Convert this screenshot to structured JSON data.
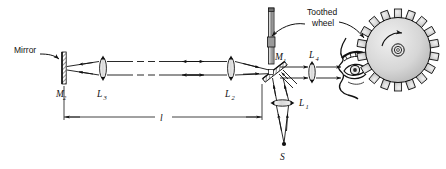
{
  "figure": {
    "type": "optics-ray-diagram",
    "background": "#ffffff",
    "ink": "#111111"
  },
  "labels": {
    "mirror": "Mirror",
    "toothed_wheel_line1": "Toothed",
    "toothed_wheel_line2": "wheel",
    "mirror_far": "M",
    "mirror_far_sub": "2",
    "beam_splitter": "M",
    "beam_splitter_sub": "1",
    "lens1": "L",
    "lens1_sub": "1",
    "lens2": "L",
    "lens2_sub": "2",
    "lens3": "L",
    "lens3_sub": "3",
    "lens4": "L",
    "lens4_sub": "4",
    "source": "S",
    "distance": "l"
  },
  "components": [
    {
      "name": "mirror-M2",
      "label": "M2",
      "kind": "plane-mirror",
      "x": 62,
      "y": 62,
      "orientation": "vertical"
    },
    {
      "name": "lens-L3",
      "label": "L3",
      "kind": "converging-lens",
      "x": 103,
      "y": 68,
      "orientation": "vertical"
    },
    {
      "name": "lens-L2",
      "label": "L2",
      "kind": "converging-lens",
      "x": 231,
      "y": 68,
      "orientation": "vertical"
    },
    {
      "name": "beam-splitter-M1",
      "label": "M1",
      "kind": "tilted-half-silvered-mirror",
      "x": 275,
      "y": 72,
      "orientation": "tilted"
    },
    {
      "name": "lens-L4",
      "label": "L4",
      "kind": "converging-lens",
      "x": 312,
      "y": 72,
      "orientation": "vertical"
    },
    {
      "name": "lens-L1",
      "label": "L1",
      "kind": "converging-lens",
      "x": 281,
      "y": 103,
      "orientation": "horizontal"
    },
    {
      "name": "source-S",
      "label": "S",
      "kind": "point-light-source",
      "x": 284,
      "y": 145
    },
    {
      "name": "toothed-wheel",
      "label": "Toothed wheel",
      "kind": "rotating-gear",
      "x": 398,
      "y": 50,
      "teeth": 18
    },
    {
      "name": "wheel-shaft",
      "kind": "vertical-shaft",
      "x": 271,
      "y": 30
    },
    {
      "name": "observer-eye",
      "kind": "eye-profile",
      "x": 345,
      "y": 70
    }
  ],
  "beams": {
    "long_arm_note": "two parallel rays between L3 and L2 with a break (dashed) segment and double arrowheads indicating light travelling both directions",
    "dashed_break": true,
    "bidirectional": true
  },
  "dimension": {
    "name": "baseline-length",
    "symbol": "l",
    "from": "M2",
    "to": "M1",
    "y": 117
  }
}
